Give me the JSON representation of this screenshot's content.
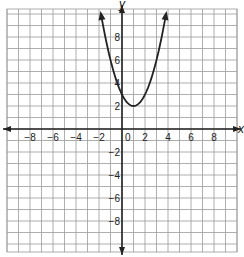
{
  "chart_data": {
    "type": "line",
    "title": "",
    "xlabel": "x",
    "ylabel": "y",
    "xlim": [
      -10,
      10
    ],
    "ylim": [
      -10,
      10
    ],
    "grid": true,
    "x_ticks": [
      -8,
      -6,
      -4,
      -2,
      0,
      2,
      4,
      6,
      8
    ],
    "y_ticks": [
      -8,
      -6,
      -4,
      -2,
      2,
      4,
      6,
      8
    ],
    "x_tick_labels": [
      "−8",
      "−6",
      "−4",
      "−2",
      "0",
      "2",
      "4",
      "6",
      "8"
    ],
    "y_tick_labels": [
      "−8",
      "−6",
      "−4",
      "−2",
      "2",
      "4",
      "6",
      "8"
    ],
    "series": [
      {
        "name": "parabola",
        "equation": "y = (x - 1)^2 + 2",
        "vertex": [
          1,
          2
        ],
        "y_intercept": 3,
        "x": [
          -1.83,
          -1,
          0,
          1,
          2,
          3,
          3.83
        ],
        "values": [
          10,
          6,
          3,
          2,
          3,
          6,
          10
        ]
      }
    ]
  },
  "labels": {
    "x_axis": "x",
    "y_axis": "y"
  },
  "colors": {
    "grid": "#9a9a9a",
    "axis": "#222222",
    "curve": "#222222",
    "background": "#ffffff"
  }
}
